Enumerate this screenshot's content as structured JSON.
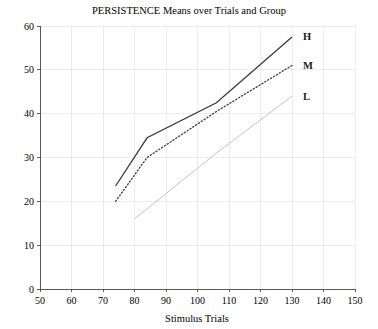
{
  "chart_data": {
    "type": "line",
    "title": "PERSISTENCE Means over Trials and Group",
    "xlabel": "Stimulus Trials",
    "ylabel": "",
    "xlim": [
      50,
      150
    ],
    "ylim": [
      0,
      60
    ],
    "xticks": [
      50,
      60,
      70,
      80,
      90,
      100,
      110,
      120,
      130,
      140,
      150
    ],
    "yticks": [
      0,
      10,
      20,
      30,
      40,
      50,
      60
    ],
    "xtick_labels": [
      "50",
      "60",
      "70",
      "80",
      "90",
      "100",
      "110",
      "120",
      "130",
      "140",
      "150"
    ],
    "ytick_labels": [
      "0",
      "10",
      "20",
      "30",
      "40",
      "50",
      "60"
    ],
    "grid": true,
    "legend_position": "right-inline-end-of-line",
    "series": [
      {
        "name": "H",
        "label": "H",
        "style": "solid",
        "color": "#3a3a3a",
        "x": [
          74,
          84,
          106,
          130
        ],
        "values": [
          23.5,
          34.5,
          42.5,
          57.5
        ]
      },
      {
        "name": "M",
        "label": "M",
        "style": "dotted",
        "color": "#3a3a3a",
        "x": [
          74,
          84,
          106,
          130
        ],
        "values": [
          20.0,
          30.0,
          40.5,
          51.0
        ]
      },
      {
        "name": "L",
        "label": "L",
        "style": "solid-light",
        "color": "#c2c2c2",
        "x": [
          80,
          106,
          130
        ],
        "values": [
          16.0,
          31.0,
          44.0
        ]
      }
    ]
  },
  "labels": {
    "series_h": "H",
    "series_m": "M",
    "series_l": "L"
  }
}
